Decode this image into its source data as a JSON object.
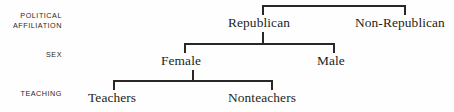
{
  "figure": {
    "type": "hierarchical-tree-diagram",
    "title": "",
    "background_color": "#fefefe",
    "line_color": "#2a2724",
    "text_color": "#231f20"
  },
  "row_labels": [
    {
      "id": "political-affiliation",
      "text": "POLITICAL\nAFFILIATION"
    },
    {
      "id": "sex",
      "text": "SEX"
    },
    {
      "id": "teaching",
      "text": "TEACHING"
    }
  ],
  "nodes": [
    {
      "id": "republican",
      "label": "Republican",
      "level": "political-affiliation"
    },
    {
      "id": "non-republican",
      "label": "Non-Republican",
      "level": "political-affiliation"
    },
    {
      "id": "female",
      "label": "Female",
      "level": "sex"
    },
    {
      "id": "male",
      "label": "Male",
      "level": "sex"
    },
    {
      "id": "teachers",
      "label": "Teachers",
      "level": "teaching"
    },
    {
      "id": "nonteachers",
      "label": "Nonteachers",
      "level": "teaching"
    }
  ],
  "edges": [
    {
      "from": "root",
      "to": "republican"
    },
    {
      "from": "root",
      "to": "non-republican"
    },
    {
      "from": "republican",
      "to": "female"
    },
    {
      "from": "republican",
      "to": "male"
    },
    {
      "from": "female",
      "to": "teachers"
    },
    {
      "from": "female",
      "to": "nonteachers"
    }
  ]
}
